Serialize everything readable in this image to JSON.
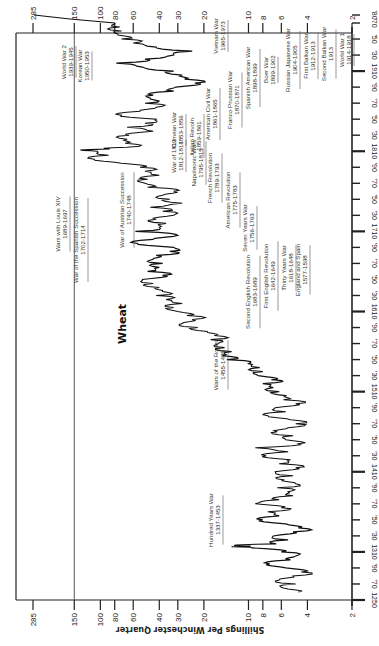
{
  "chart_data": {
    "type": "line",
    "orientation": "rotated-90-clockwise",
    "title": "",
    "series_label": "Wheat",
    "xlabel": "Year",
    "ylabel": "Shillings Per Winchester Quarter",
    "y_scale": "log",
    "ylim": [
      2,
      285
    ],
    "xlim": [
      1250,
      1980
    ],
    "y_ticks": [
      285,
      150,
      100,
      80,
      60,
      40,
      30,
      20,
      10,
      8,
      6,
      4,
      2
    ],
    "x_ticks": [
      {
        "year": 1250,
        "label": "1250"
      },
      {
        "year": 1270,
        "label": "'70"
      },
      {
        "year": 1290,
        "label": "'90"
      },
      {
        "year": 1310,
        "label": "1310"
      },
      {
        "year": 1330,
        "label": "'30"
      },
      {
        "year": 1350,
        "label": "'50"
      },
      {
        "year": 1370,
        "label": "'70"
      },
      {
        "year": 1390,
        "label": "'90"
      },
      {
        "year": 1410,
        "label": "1410"
      },
      {
        "year": 1430,
        "label": "'30"
      },
      {
        "year": 1450,
        "label": "'50"
      },
      {
        "year": 1470,
        "label": "'70"
      },
      {
        "year": 1490,
        "label": "'90"
      },
      {
        "year": 1510,
        "label": "1510"
      },
      {
        "year": 1530,
        "label": "'30"
      },
      {
        "year": 1550,
        "label": "'50"
      },
      {
        "year": 1570,
        "label": "'70"
      },
      {
        "year": 1590,
        "label": "'90"
      },
      {
        "year": 1610,
        "label": "1610"
      },
      {
        "year": 1630,
        "label": "'30"
      },
      {
        "year": 1650,
        "label": "'50"
      },
      {
        "year": 1670,
        "label": "'70"
      },
      {
        "year": 1690,
        "label": "'90"
      },
      {
        "year": 1710,
        "label": "1710"
      },
      {
        "year": 1730,
        "label": "'30"
      },
      {
        "year": 1750,
        "label": "'50"
      },
      {
        "year": 1770,
        "label": "'70"
      },
      {
        "year": 1790,
        "label": "'90"
      },
      {
        "year": 1810,
        "label": "1810"
      },
      {
        "year": 1830,
        "label": "'30"
      },
      {
        "year": 1850,
        "label": "'50"
      },
      {
        "year": 1870,
        "label": "'70"
      },
      {
        "year": 1890,
        "label": "'90"
      },
      {
        "year": 1910,
        "label": "1910"
      },
      {
        "year": 1930,
        "label": "'30"
      },
      {
        "year": 1950,
        "label": "'50"
      },
      {
        "year": 1970,
        "label": "'70"
      },
      {
        "year": 1980,
        "label": "'80"
      }
    ],
    "reference_line": {
      "value": 150
    },
    "series": [
      {
        "name": "Wheat",
        "points": [
          [
            1260,
            4.6
          ],
          [
            1265,
            5.8
          ],
          [
            1270,
            4.8
          ],
          [
            1275,
            6.2
          ],
          [
            1280,
            5.0
          ],
          [
            1285,
            4.4
          ],
          [
            1290,
            5.6
          ],
          [
            1295,
            7.2
          ],
          [
            1300,
            5.2
          ],
          [
            1305,
            4.8
          ],
          [
            1310,
            6.0
          ],
          [
            1315,
            9.5
          ],
          [
            1318,
            12.5
          ],
          [
            1320,
            6.5
          ],
          [
            1325,
            5.4
          ],
          [
            1330,
            6.8
          ],
          [
            1335,
            5.0
          ],
          [
            1340,
            4.6
          ],
          [
            1345,
            5.6
          ],
          [
            1350,
            8.0
          ],
          [
            1355,
            6.2
          ],
          [
            1360,
            7.4
          ],
          [
            1365,
            6.0
          ],
          [
            1370,
            9.0
          ],
          [
            1375,
            6.2
          ],
          [
            1380,
            5.0
          ],
          [
            1385,
            5.4
          ],
          [
            1390,
            6.4
          ],
          [
            1395,
            4.8
          ],
          [
            1400,
            5.8
          ],
          [
            1405,
            5.0
          ],
          [
            1410,
            6.6
          ],
          [
            1415,
            4.8
          ],
          [
            1420,
            6.2
          ],
          [
            1425,
            5.2
          ],
          [
            1430,
            7.6
          ],
          [
            1435,
            5.4
          ],
          [
            1440,
            9.0
          ],
          [
            1445,
            4.6
          ],
          [
            1450,
            5.6
          ],
          [
            1455,
            5.0
          ],
          [
            1460,
            6.4
          ],
          [
            1465,
            5.4
          ],
          [
            1470,
            4.8
          ],
          [
            1475,
            5.2
          ],
          [
            1480,
            7.4
          ],
          [
            1485,
            5.6
          ],
          [
            1490,
            6.6
          ],
          [
            1495,
            4.8
          ],
          [
            1500,
            5.8
          ],
          [
            1505,
            5.6
          ],
          [
            1510,
            6.2
          ],
          [
            1515,
            6.8
          ],
          [
            1520,
            8.0
          ],
          [
            1525,
            7.0
          ],
          [
            1530,
            8.6
          ],
          [
            1535,
            8.0
          ],
          [
            1540,
            8.4
          ],
          [
            1545,
            10.0
          ],
          [
            1550,
            14.0
          ],
          [
            1555,
            15.0
          ],
          [
            1560,
            13.0
          ],
          [
            1565,
            14.5
          ],
          [
            1570,
            16.0
          ],
          [
            1575,
            18.0
          ],
          [
            1580,
            17.0
          ],
          [
            1585,
            19.0
          ],
          [
            1590,
            22.0
          ],
          [
            1595,
            28.0
          ],
          [
            1600,
            24.0
          ],
          [
            1605,
            26.0
          ],
          [
            1610,
            30.0
          ],
          [
            1615,
            32.0
          ],
          [
            1620,
            28.0
          ],
          [
            1625,
            36.0
          ],
          [
            1630,
            42.0
          ],
          [
            1635,
            38.0
          ],
          [
            1640,
            40.0
          ],
          [
            1645,
            44.0
          ],
          [
            1650,
            52.0
          ],
          [
            1655,
            38.0
          ],
          [
            1660,
            48.0
          ],
          [
            1665,
            40.0
          ],
          [
            1670,
            38.0
          ],
          [
            1675,
            44.0
          ],
          [
            1680,
            42.0
          ],
          [
            1685,
            34.0
          ],
          [
            1690,
            32.0
          ],
          [
            1695,
            56.0
          ],
          [
            1700,
            44.0
          ],
          [
            1705,
            30.0
          ],
          [
            1710,
            58.0
          ],
          [
            1715,
            40.0
          ],
          [
            1720,
            36.0
          ],
          [
            1725,
            42.0
          ],
          [
            1730,
            32.0
          ],
          [
            1735,
            38.0
          ],
          [
            1740,
            46.0
          ],
          [
            1745,
            28.0
          ],
          [
            1750,
            34.0
          ],
          [
            1755,
            38.0
          ],
          [
            1760,
            32.0
          ],
          [
            1765,
            48.0
          ],
          [
            1770,
            50.0
          ],
          [
            1775,
            48.0
          ],
          [
            1780,
            40.0
          ],
          [
            1785,
            50.0
          ],
          [
            1790,
            54.0
          ],
          [
            1795,
            72.0
          ],
          [
            1800,
            110.0
          ],
          [
            1805,
            88.0
          ],
          [
            1810,
            105.0
          ],
          [
            1812,
            120.0
          ],
          [
            1815,
            66.0
          ],
          [
            1820,
            68.0
          ],
          [
            1825,
            66.0
          ],
          [
            1830,
            64.0
          ],
          [
            1835,
            44.0
          ],
          [
            1840,
            66.0
          ],
          [
            1845,
            50.0
          ],
          [
            1850,
            42.0
          ],
          [
            1855,
            72.0
          ],
          [
            1860,
            54.0
          ],
          [
            1865,
            42.0
          ],
          [
            1870,
            50.0
          ],
          [
            1875,
            46.0
          ],
          [
            1880,
            44.0
          ],
          [
            1885,
            32.0
          ],
          [
            1890,
            31.0
          ],
          [
            1895,
            23.0
          ],
          [
            1900,
            27.0
          ],
          [
            1905,
            28.0
          ],
          [
            1910,
            32.0
          ],
          [
            1915,
            52.0
          ],
          [
            1920,
            78.0
          ],
          [
            1925,
            50.0
          ],
          [
            1930,
            32.0
          ],
          [
            1935,
            24.0
          ],
          [
            1940,
            42.0
          ],
          [
            1945,
            60.0
          ],
          [
            1950,
            72.0
          ],
          [
            1955,
            76.0
          ],
          [
            1960,
            72.0
          ],
          [
            1965,
            74.0
          ],
          [
            1970,
            80.0
          ],
          [
            1975,
            160.0
          ],
          [
            1980,
            280.0
          ]
        ]
      }
    ],
    "annotations": [
      {
        "name": "Hundred Years War",
        "years": "1337-1453"
      },
      {
        "name": "Wars of the Roses",
        "years": "1455-1485"
      },
      {
        "name": "England and Spain",
        "years": "1577-1598"
      },
      {
        "name": "Thirty Years War",
        "years": "1618-1648"
      },
      {
        "name": "First English Revolution",
        "years": "1642-1649"
      },
      {
        "name": "Second English Revolution",
        "years": "1683-1689"
      },
      {
        "name": "Wars with Louis XIV",
        "years": "1689-1697"
      },
      {
        "name": "War of the Spanish Succession",
        "years": "1702-1714"
      },
      {
        "name": "War of Austrian Succession",
        "years": "1740-1748"
      },
      {
        "name": "Seven Years War",
        "years": "1756-1763"
      },
      {
        "name": "American Revolution",
        "years": "1775-1783"
      },
      {
        "name": "French Revolution",
        "years": "1789-1793"
      },
      {
        "name": "Napoleonic Wars",
        "years": "1795-1815"
      },
      {
        "name": "War of 1812",
        "years": "1812-1814"
      },
      {
        "name": "Crimean War",
        "years": "1853-1856"
      },
      {
        "name": "Italian Revoln.",
        "years": "1859-1861"
      },
      {
        "name": "American Civil War",
        "years": "1861-1865"
      },
      {
        "name": "Franco Prussian War",
        "years": "1870-1871"
      },
      {
        "name": "Spanish American War",
        "years": "1898-1899"
      },
      {
        "name": "Boer War",
        "years": "1899-1902"
      },
      {
        "name": "Russian Japanese War",
        "years": "1904-1905"
      },
      {
        "name": "First Balkan War",
        "years": "1912-1913"
      },
      {
        "name": "Second Balkan War",
        "years": "1913"
      },
      {
        "name": "World War 1",
        "years": "1914-1918"
      },
      {
        "name": "World War 2",
        "years": "1939-1945"
      },
      {
        "name": "Korean War",
        "years": "1950-1953"
      },
      {
        "name": "Vietnam War",
        "years": "1965-1973"
      }
    ],
    "grid": false,
    "legend": "none"
  }
}
